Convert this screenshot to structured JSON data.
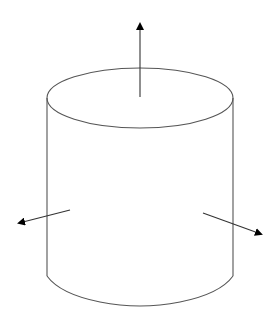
{
  "diagram": {
    "title": "",
    "colors": {
      "outline": "#555555",
      "arrow": "#333333",
      "arrowhead": "#000000",
      "background": "#ffffff"
    },
    "cylinder": {
      "cx": 140,
      "top_cy": 98,
      "rx": 93,
      "ry": 30,
      "side_bottom_y": 276,
      "bottom_arc_depth": 31
    },
    "arrows": [
      {
        "name": "top-normal-arrow",
        "direction": "up",
        "x1": 140,
        "y1": 97,
        "x2": 140,
        "y2": 22
      },
      {
        "name": "left-normal-arrow",
        "direction": "left",
        "x1": 70,
        "y1": 210,
        "x2": 18,
        "y2": 223
      },
      {
        "name": "right-normal-arrow",
        "direction": "right",
        "x1": 203,
        "y1": 213,
        "x2": 262,
        "y2": 234
      }
    ]
  }
}
